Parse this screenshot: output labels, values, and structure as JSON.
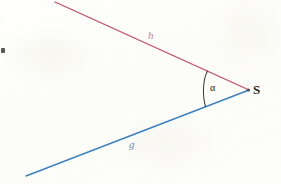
{
  "figure": {
    "background_color": "#fdfdfa",
    "width": 281,
    "height": 184,
    "labels": {
      "ray_h": "h",
      "ray_g": "g",
      "angle": "α",
      "vertex": "S"
    },
    "colors": {
      "ray_h_color": "#cb4b66",
      "ray_g_color": "#3a80c2",
      "ray_h_label_color": "#cf7f90",
      "ray_g_label_color": "#5d8fbe",
      "angle_arc_color": "#3a3a3a",
      "text_color": "#1c1c1c"
    },
    "geometry": {
      "vertex_point": {
        "x": 248,
        "y": 90
      },
      "ray_h_start": {
        "x": 55,
        "y": 2
      },
      "ray_g_start": {
        "x": 26,
        "y": 176
      },
      "arc_start_on_h": {
        "x": 206,
        "y": 70
      },
      "arc_end_on_g": {
        "x": 206,
        "y": 107
      }
    }
  }
}
